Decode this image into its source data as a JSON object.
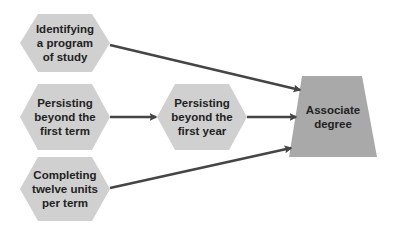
{
  "diagram": {
    "type": "flow",
    "colors": {
      "hexagon_fill": "#d0d0d0",
      "trapezoid_fill": "#a9a9a9",
      "arrow": "#454545",
      "text": "#222222",
      "background": "#ffffff"
    },
    "nodes": [
      {
        "id": "n1",
        "shape": "hexagon",
        "label": "Identifying\na program\nof study"
      },
      {
        "id": "n2",
        "shape": "hexagon",
        "label": "Persisting\nbeyond the\nfirst term"
      },
      {
        "id": "n3",
        "shape": "hexagon",
        "label": "Completing\ntwelve units\nper term"
      },
      {
        "id": "n4",
        "shape": "hexagon",
        "label": "Persisting\nbeyond the\nfirst year"
      },
      {
        "id": "n5",
        "shape": "trapezoid",
        "label": "Associate\ndegree"
      }
    ],
    "edges": [
      {
        "from": "n1",
        "to": "n5"
      },
      {
        "from": "n2",
        "to": "n4"
      },
      {
        "from": "n4",
        "to": "n5"
      },
      {
        "from": "n3",
        "to": "n5"
      }
    ]
  }
}
